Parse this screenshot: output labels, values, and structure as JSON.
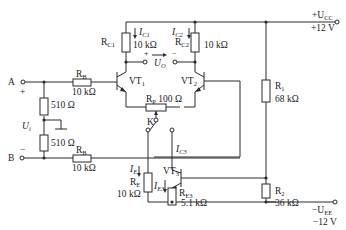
{
  "diagram": {
    "type": "circuit",
    "supply": {
      "positive": {
        "label": "+U",
        "sub": "CC",
        "value": "+12 V"
      },
      "negative": {
        "label": "−U",
        "sub": "EE",
        "value": "−12 V"
      }
    },
    "inputs": {
      "A": {
        "label": "A",
        "sign": "+"
      },
      "B": {
        "label": "B",
        "sign": "−"
      },
      "Ui": {
        "label": "U",
        "sub": "i"
      }
    },
    "output": {
      "label": "U",
      "sub": "O",
      "plus": "+",
      "minus": "−"
    },
    "components": {
      "RC1": {
        "name": "R",
        "sub": "C1",
        "value": "10 kΩ"
      },
      "RC2": {
        "name": "R",
        "sub": "C2",
        "value": "10 kΩ"
      },
      "RB1": {
        "name": "R",
        "sub": "B",
        "value": "10 kΩ"
      },
      "RB2": {
        "name": "R",
        "sub": "B",
        "value": "10 kΩ"
      },
      "R510a": {
        "value": "510 Ω"
      },
      "R510b": {
        "value": "510 Ω"
      },
      "RP": {
        "name": "R",
        "sub": "P",
        "value": "100 Ω"
      },
      "R1": {
        "name": "R",
        "sub": "1",
        "value": "68 kΩ"
      },
      "R2": {
        "name": "R",
        "sub": "2",
        "value": "36 kΩ"
      },
      "RE": {
        "name": "R",
        "sub": "E",
        "value": "10 kΩ"
      },
      "RE3": {
        "name": "R",
        "sub": "E3",
        "value": "5.1 kΩ"
      },
      "VT1": {
        "name": "VT",
        "sub": "1"
      },
      "VT2": {
        "name": "VT",
        "sub": "2"
      },
      "VT3": {
        "name": "VT",
        "sub": "3"
      },
      "K": {
        "name": "K"
      }
    },
    "currents": {
      "IC1": {
        "name": "I",
        "sub": "C1"
      },
      "IC2": {
        "name": "I",
        "sub": "C2"
      },
      "IC3": {
        "name": "I",
        "sub": "C3"
      },
      "IE": {
        "name": "I",
        "sub": "E"
      },
      "IE3": {
        "name": "I",
        "sub": "E3"
      }
    }
  }
}
